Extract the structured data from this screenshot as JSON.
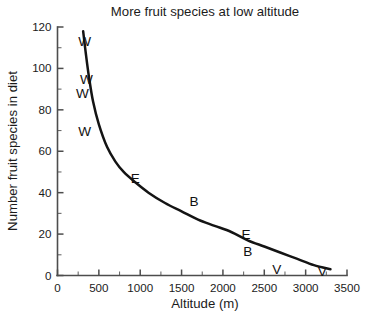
{
  "chart_data": {
    "type": "scatter",
    "title": "More  fruit species at low altitude",
    "xlabel": "Altitude (m)",
    "ylabel": "Number  fruit species in diet",
    "xlim": [
      0,
      3500
    ],
    "ylim": [
      0,
      120
    ],
    "xticks": [
      0,
      500,
      1000,
      1500,
      2000,
      2500,
      3000,
      3500
    ],
    "yticks": [
      0,
      20,
      40,
      60,
      80,
      100,
      120
    ],
    "xtick_labels": [
      "0",
      "500",
      "1000",
      "1500",
      "2000",
      "2500",
      "3000",
      "3500"
    ],
    "ytick_labels": [
      "0",
      "20",
      "40",
      "60",
      "80",
      "100",
      "120"
    ],
    "x_minor_step": 250,
    "y_minor_step": 10,
    "grid": false,
    "legend": "none",
    "marker_style": "letter-codes",
    "points": [
      {
        "label": "W",
        "x": 330,
        "y": 113
      },
      {
        "label": "W",
        "x": 350,
        "y": 95
      },
      {
        "label": "W",
        "x": 300,
        "y": 88
      },
      {
        "label": "W",
        "x": 330,
        "y": 70
      },
      {
        "label": "E",
        "x": 940,
        "y": 47
      },
      {
        "label": "B",
        "x": 1650,
        "y": 36
      },
      {
        "label": "E",
        "x": 2280,
        "y": 20
      },
      {
        "label": "B",
        "x": 2300,
        "y": 12
      },
      {
        "label": "V",
        "x": 2650,
        "y": 3
      },
      {
        "label": "V",
        "x": 3200,
        "y": 2
      }
    ],
    "fit_curve": {
      "description": "decaying power-law trend line through points",
      "x": [
        310,
        340,
        380,
        430,
        500,
        600,
        700,
        800,
        940,
        1100,
        1300,
        1500,
        1700,
        1900,
        2100,
        2300,
        2500,
        2700,
        2900,
        3100,
        3300
      ],
      "y": [
        118,
        108,
        96,
        84,
        73,
        62,
        55,
        50,
        45,
        40,
        35,
        31,
        27,
        24,
        21,
        17,
        14,
        11,
        8,
        5,
        3
      ]
    }
  },
  "colors": {
    "curve": "#141414",
    "axis": "#4d4d4d",
    "text": "#1b1b1b",
    "background": "#ffffff"
  }
}
